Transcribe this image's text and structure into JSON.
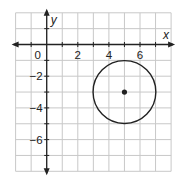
{
  "diagram": {
    "type": "coordinate-plane",
    "x_axis_label": "x",
    "y_axis_label": "y",
    "x_range": [
      -2,
      8
    ],
    "y_range": [
      -8,
      2
    ],
    "grid_step": 1,
    "x_tick_labels": [
      {
        "value": 0,
        "text": "0"
      },
      {
        "value": 2,
        "text": "2"
      },
      {
        "value": 4,
        "text": "4"
      },
      {
        "value": 6,
        "text": "6"
      }
    ],
    "y_tick_labels": [
      {
        "value": -2,
        "text": "−2"
      },
      {
        "value": -4,
        "text": "−4"
      },
      {
        "value": -6,
        "text": "−6"
      }
    ],
    "circle": {
      "center_x": 5,
      "center_y": -3,
      "radius": 2
    },
    "center_point": {
      "x": 5,
      "y": -3
    }
  },
  "colors": {
    "grid": "#c8c8c8",
    "axis": "#222222",
    "circle": "#222222",
    "background": "#ffffff"
  }
}
